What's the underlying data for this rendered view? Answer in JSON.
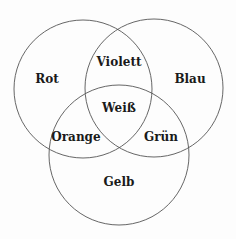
{
  "diagram": {
    "type": "venn",
    "circles": [
      {
        "name": "Rot",
        "cx": 83,
        "cy": 89,
        "r": 69
      },
      {
        "name": "Blau",
        "cx": 154,
        "cy": 88,
        "r": 69
      },
      {
        "name": "Gelb",
        "cx": 119,
        "cy": 155,
        "r": 70
      }
    ],
    "stroke_color": "#555555",
    "regions": {
      "rot": {
        "label": "Rot",
        "x": 47,
        "y": 79
      },
      "blau": {
        "label": "Blau",
        "x": 190,
        "y": 79
      },
      "violett": {
        "label": "Violett",
        "x": 119,
        "y": 62
      },
      "weiss": {
        "label": "Weiß",
        "x": 119,
        "y": 108
      },
      "orange": {
        "label": "Orange",
        "x": 76,
        "y": 137
      },
      "gruen": {
        "label": "Grün",
        "x": 161,
        "y": 137
      },
      "gelb": {
        "label": "Gelb",
        "x": 119,
        "y": 182
      }
    }
  }
}
